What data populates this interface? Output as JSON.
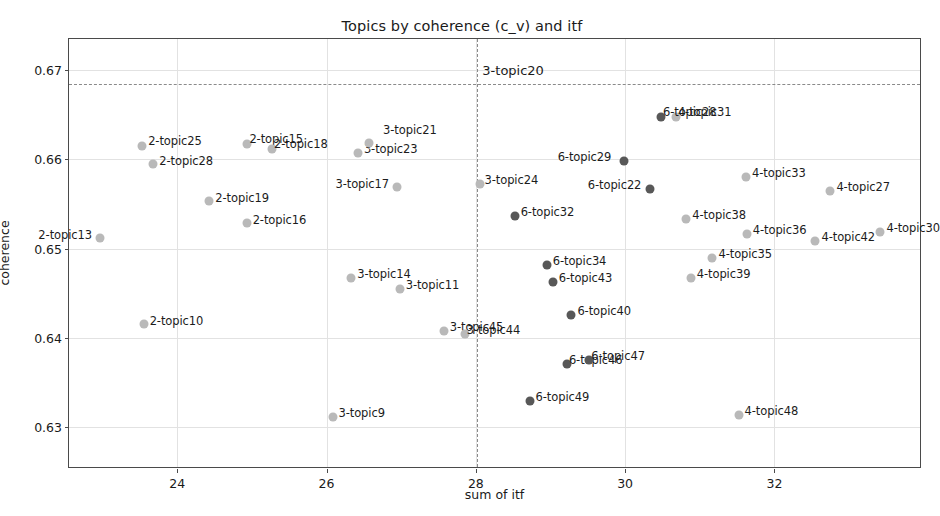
{
  "chart_data": {
    "type": "scatter",
    "title": "Topics by coherence (c_v) and itf",
    "xlabel": "sum of itf",
    "ylabel": "coherence",
    "xlim": [
      22.55,
      33.95
    ],
    "ylim": [
      0.6255,
      0.6735
    ],
    "xticks": [
      24,
      26,
      28,
      30,
      32
    ],
    "xtick_labels": [
      "24",
      "26",
      "28",
      "30",
      "32"
    ],
    "yticks": [
      0.63,
      0.64,
      0.65,
      0.66,
      0.67
    ],
    "ytick_labels": [
      "0.63",
      "0.64",
      "0.65",
      "0.66",
      "0.67"
    ],
    "grid": true,
    "legend": null,
    "reference_lines": {
      "vertical_x": 28.02,
      "horizontal_y": 0.6685,
      "annotation": "3-topic20",
      "style": "dashed",
      "color": "#8a8a8a"
    },
    "series": [
      {
        "name": "light-markers",
        "color": "#b9b9b9",
        "points": [
          {
            "label": "2-topic13",
            "x": 22.97,
            "y": 0.6512,
            "label_dx": -62,
            "label_dy": -10
          },
          {
            "label": "2-topic10",
            "x": 23.55,
            "y": 0.6415,
            "label_dx": 6,
            "label_dy": -10
          },
          {
            "label": "2-topic28",
            "x": 23.68,
            "y": 0.6595,
            "label_dx": 6,
            "label_dy": -10
          },
          {
            "label": "2-topic25",
            "x": 23.53,
            "y": 0.6615,
            "label_dx": 6,
            "label_dy": -12
          },
          {
            "label": "2-topic19",
            "x": 24.43,
            "y": 0.6553,
            "label_dx": 6,
            "label_dy": -10
          },
          {
            "label": "2-topic16",
            "x": 24.93,
            "y": 0.6529,
            "label_dx": 6,
            "label_dy": -10
          },
          {
            "label": "2-topic15",
            "x": 24.94,
            "y": 0.6617,
            "label_dx": 2,
            "label_dy": -12
          },
          {
            "label": "2-topic18",
            "x": 25.27,
            "y": 0.6612,
            "label_dx": 2,
            "label_dy": -12
          },
          {
            "label": "3-topic9",
            "x": 26.08,
            "y": 0.6311,
            "label_dx": 6,
            "label_dy": -11
          },
          {
            "label": "3-topic14",
            "x": 26.33,
            "y": 0.6467,
            "label_dx": 6,
            "label_dy": -11
          },
          {
            "label": "3-topic23",
            "x": 26.42,
            "y": 0.6607,
            "label_dx": 6,
            "label_dy": -11
          },
          {
            "label": "3-topic21",
            "x": 26.57,
            "y": 0.6618,
            "label_dx": 14,
            "label_dy": -20
          },
          {
            "label": "3-topic17",
            "x": 26.95,
            "y": 0.6569,
            "label_dx": -62,
            "label_dy": -10
          },
          {
            "label": "3-topic11",
            "x": 26.98,
            "y": 0.6455,
            "label_dx": 6,
            "label_dy": -11
          },
          {
            "label": "3-topic45",
            "x": 27.57,
            "y": 0.6407,
            "label_dx": 6,
            "label_dy": -11
          },
          {
            "label": "3-topic44",
            "x": 27.85,
            "y": 0.6404,
            "label_dx": 2,
            "label_dy": -11
          },
          {
            "label": "3-topic24",
            "x": 28.05,
            "y": 0.6572,
            "label_dx": 5,
            "label_dy": -11
          },
          {
            "label": "4-topic31",
            "x": 30.68,
            "y": 0.6648,
            "label_dx": 2,
            "label_dy": -12
          },
          {
            "label": "4-topic38",
            "x": 30.82,
            "y": 0.6533,
            "label_dx": 6,
            "label_dy": -11
          },
          {
            "label": "4-topic39",
            "x": 30.88,
            "y": 0.6467,
            "label_dx": 6,
            "label_dy": -11
          },
          {
            "label": "4-topic35",
            "x": 31.17,
            "y": 0.6489,
            "label_dx": 6,
            "label_dy": -11
          },
          {
            "label": "4-topic33",
            "x": 31.62,
            "y": 0.658,
            "label_dx": 6,
            "label_dy": -11
          },
          {
            "label": "4-topic36",
            "x": 31.63,
            "y": 0.6516,
            "label_dx": 6,
            "label_dy": -11
          },
          {
            "label": "4-topic48",
            "x": 31.52,
            "y": 0.6313,
            "label_dx": 6,
            "label_dy": -11
          },
          {
            "label": "4-topic42",
            "x": 32.55,
            "y": 0.6509,
            "label_dx": 6,
            "label_dy": -11
          },
          {
            "label": "4-topic27",
            "x": 32.75,
            "y": 0.6565,
            "label_dx": 6,
            "label_dy": -11
          },
          {
            "label": "4-topic30",
            "x": 33.42,
            "y": 0.6518,
            "label_dx": 6,
            "label_dy": -11
          }
        ]
      },
      {
        "name": "dark-markers",
        "color": "#585858",
        "points": [
          {
            "label": "6-topic32",
            "x": 28.52,
            "y": 0.6537,
            "label_dx": 6,
            "label_dy": -11
          },
          {
            "label": "6-topic34",
            "x": 28.95,
            "y": 0.6481,
            "label_dx": 6,
            "label_dy": -11
          },
          {
            "label": "6-topic43",
            "x": 29.03,
            "y": 0.6462,
            "label_dx": 6,
            "label_dy": -11
          },
          {
            "label": "6-topic40",
            "x": 29.28,
            "y": 0.6426,
            "label_dx": 6,
            "label_dy": -11
          },
          {
            "label": "6-topic49",
            "x": 28.72,
            "y": 0.6329,
            "label_dx": 6,
            "label_dy": -11
          },
          {
            "label": "6-topic46",
            "x": 29.22,
            "y": 0.6371,
            "label_dx": 2,
            "label_dy": -11
          },
          {
            "label": "6-topic47",
            "x": 29.52,
            "y": 0.6375,
            "label_dx": 2,
            "label_dy": -11
          },
          {
            "label": "6-topic29",
            "x": 29.98,
            "y": 0.6598,
            "label_dx": -66,
            "label_dy": -11
          },
          {
            "label": "6-topic22",
            "x": 30.33,
            "y": 0.6567,
            "label_dx": -62,
            "label_dy": -11
          },
          {
            "label": "6-topic28",
            "x": 30.48,
            "y": 0.6647,
            "label_dx": 2,
            "label_dy": -12
          }
        ]
      }
    ]
  }
}
